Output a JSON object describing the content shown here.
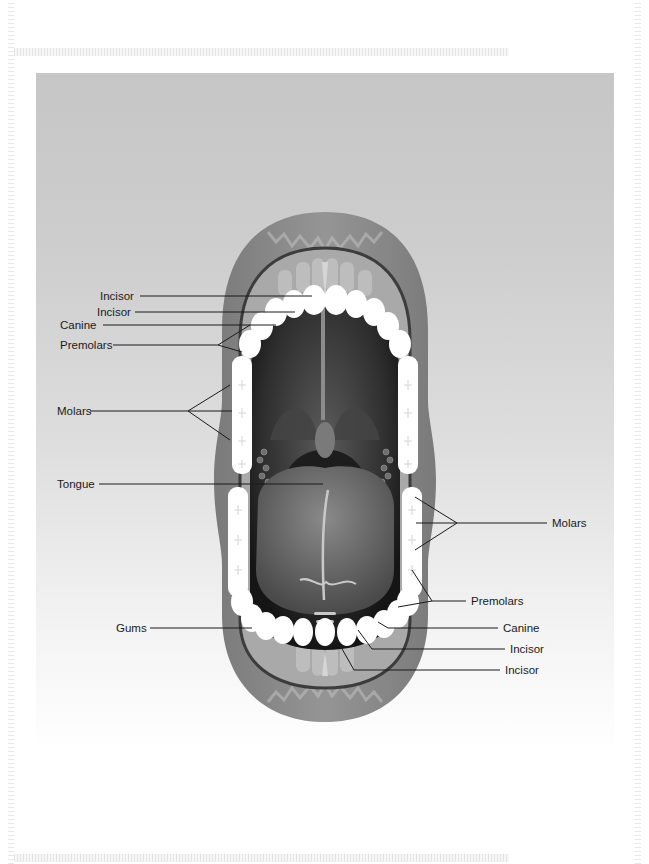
{
  "diagram": {
    "colors": {
      "panel_top": "#c6c6c6",
      "panel_bottom": "#ffffff",
      "lips": "#8a8a8a",
      "gums": "#a8a8a8",
      "cavity": "#2a2a2a",
      "teeth": "#ffffff",
      "tongue": "#6e6e6e",
      "leader_line": "#1a1a1a"
    },
    "labels_left": [
      {
        "id": "incisor-upper-1",
        "text": "Incisor"
      },
      {
        "id": "incisor-upper-2",
        "text": "Incisor"
      },
      {
        "id": "canine-upper",
        "text": "Canine"
      },
      {
        "id": "premolars-upper",
        "text": "Premolars"
      },
      {
        "id": "molars-upper",
        "text": "Molars"
      },
      {
        "id": "tongue",
        "text": "Tongue"
      },
      {
        "id": "gums",
        "text": "Gums"
      }
    ],
    "labels_right": [
      {
        "id": "molars-lower",
        "text": "Molars"
      },
      {
        "id": "premolars-lower",
        "text": "Premolars"
      },
      {
        "id": "canine-lower",
        "text": "Canine"
      },
      {
        "id": "incisor-lower-1",
        "text": "Incisor"
      },
      {
        "id": "incisor-lower-2",
        "text": "Incisor"
      }
    ]
  }
}
